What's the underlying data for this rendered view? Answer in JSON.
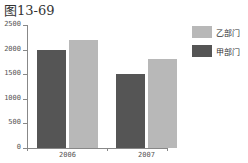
{
  "chart_data": {
    "type": "bar",
    "title": "图13-69",
    "categories": [
      "2006",
      "2007"
    ],
    "series": [
      {
        "name": "甲部门",
        "color": "#555555",
        "values": [
          2000,
          1500
        ]
      },
      {
        "name": "乙部门",
        "color": "#b8b8b8",
        "values": [
          2200,
          1800
        ]
      }
    ],
    "xlabel": "",
    "ylabel": "",
    "ylim": [
      0,
      2500
    ],
    "yticks": [
      "0",
      "500",
      "1000",
      "1500",
      "2000",
      "2500"
    ],
    "grid": false,
    "legend_position": "right"
  },
  "legend": [
    {
      "label": "乙部门"
    },
    {
      "label": "甲部门"
    }
  ]
}
